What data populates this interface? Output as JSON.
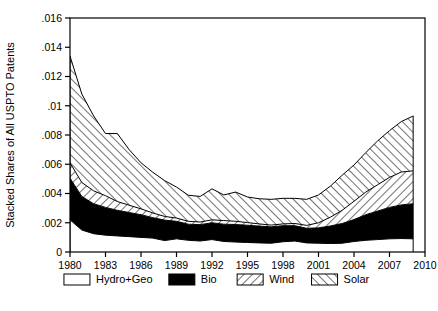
{
  "figure": {
    "ylabel": "Stacked Shares of All USPTO Patents",
    "top_fragment": "",
    "caption_fragment": ""
  },
  "axes": {
    "y_ticks": [
      "0",
      ".002",
      ".004",
      ".006",
      ".008",
      ".01",
      ".012",
      ".014",
      ".016"
    ],
    "x_ticks": [
      "1980",
      "1983",
      "1986",
      "1989",
      "1992",
      "1995",
      "1998",
      "2001",
      "2004",
      "2007",
      "2010"
    ]
  },
  "legend": {
    "items": [
      {
        "label": "Hydro+Geo",
        "pattern": "empty",
        "color": "#ffffff"
      },
      {
        "label": "Bio",
        "pattern": "solid",
        "color": "#000000"
      },
      {
        "label": "Wind",
        "pattern": "backslash-hatch",
        "color": "#ffffff"
      },
      {
        "label": "Solar",
        "pattern": "forwardslash-hatch",
        "color": "#ffffff"
      }
    ]
  },
  "chart_data": {
    "type": "area",
    "stacked": true,
    "title": "",
    "xlabel": "",
    "ylabel": "Stacked Shares of All USPTO Patents",
    "xlim": [
      1980,
      2010
    ],
    "ylim": [
      0,
      0.016
    ],
    "grid": false,
    "legend_position": "bottom",
    "x": [
      1980,
      1981,
      1982,
      1983,
      1984,
      1985,
      1986,
      1987,
      1988,
      1989,
      1990,
      1991,
      1992,
      1993,
      1994,
      1995,
      1996,
      1997,
      1998,
      1999,
      2000,
      2001,
      2002,
      2003,
      2004,
      2005,
      2006,
      2007,
      2008,
      2009
    ],
    "series": [
      {
        "name": "Hydro+Geo",
        "pattern": "empty",
        "values": [
          0.0022,
          0.0015,
          0.00125,
          0.00115,
          0.0011,
          0.00105,
          0.001,
          0.00095,
          0.00078,
          0.0009,
          0.0008,
          0.00075,
          0.00085,
          0.00072,
          0.00068,
          0.00065,
          0.00062,
          0.0006,
          0.0007,
          0.00075,
          0.00062,
          0.0006,
          0.00058,
          0.0006,
          0.00072,
          0.0008,
          0.00085,
          0.0009,
          0.00092,
          0.0009
        ]
      },
      {
        "name": "Bio",
        "pattern": "solid",
        "values": [
          0.00285,
          0.0023,
          0.00205,
          0.0019,
          0.00175,
          0.00165,
          0.00155,
          0.0014,
          0.0014,
          0.0012,
          0.0011,
          0.00112,
          0.00115,
          0.00118,
          0.0012,
          0.00118,
          0.00115,
          0.00112,
          0.0011,
          0.00105,
          0.001,
          0.00105,
          0.0012,
          0.00135,
          0.0015,
          0.00175,
          0.00195,
          0.00215,
          0.0023,
          0.0024
        ]
      },
      {
        "name": "Wind",
        "pattern": "backslash-hatch",
        "values": [
          0.00105,
          0.00095,
          0.00088,
          0.0008,
          0.0006,
          0.0005,
          0.0004,
          0.00032,
          0.00025,
          0.00022,
          0.0002,
          0.00018,
          0.0002,
          0.00025,
          0.00022,
          0.00018,
          0.00015,
          0.00012,
          0.00012,
          0.00015,
          0.0002,
          0.00035,
          0.0006,
          0.0009,
          0.00125,
          0.00155,
          0.0018,
          0.00205,
          0.00225,
          0.00225
        ]
      },
      {
        "name": "Solar",
        "pattern": "forwardslash-hatch",
        "values": [
          0.0073,
          0.00605,
          0.00512,
          0.00425,
          0.00465,
          0.0038,
          0.00315,
          0.00278,
          0.00245,
          0.00212,
          0.00178,
          0.00175,
          0.00212,
          0.00175,
          0.002,
          0.00175,
          0.00172,
          0.00176,
          0.00175,
          0.00172,
          0.00178,
          0.0019,
          0.00212,
          0.0024,
          0.00248,
          0.0027,
          0.003,
          0.0032,
          0.00345,
          0.00375
        ]
      }
    ],
    "totals": [
      0.0134,
      0.0108,
      0.0093,
      0.0081,
      0.0081,
      0.007,
      0.0061,
      0.00545,
      0.00488,
      0.00444,
      0.00388,
      0.0038,
      0.00432,
      0.0039,
      0.0041,
      0.00376,
      0.00364,
      0.0036,
      0.00367,
      0.00367,
      0.0036,
      0.0039,
      0.0045,
      0.00525,
      0.00595,
      0.0068,
      0.0076,
      0.0083,
      0.00892,
      0.0093
    ]
  }
}
